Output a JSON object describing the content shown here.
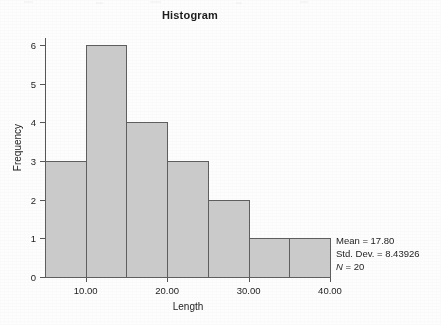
{
  "chart_data": {
    "type": "bar",
    "title": "Histogram",
    "xlabel": "Length",
    "ylabel": "Frequency",
    "categories": [
      "5-10",
      "10-15",
      "15-20",
      "20-25",
      "25-30",
      "30-35",
      "35-40"
    ],
    "bin_edges": [
      5,
      10,
      15,
      20,
      25,
      30,
      35,
      40
    ],
    "values": [
      3,
      6,
      4,
      3,
      2,
      1,
      1
    ],
    "bin_width": 5,
    "xlim": [
      5,
      40
    ],
    "ylim": [
      0,
      6
    ],
    "x_ticks": [
      10,
      20,
      30,
      40
    ],
    "x_tick_labels": [
      "10.00",
      "20.00",
      "30.00",
      "40.00"
    ],
    "y_ticks": [
      0,
      1,
      2,
      3,
      4,
      5,
      6
    ],
    "y_tick_labels": [
      "0",
      "1",
      "2",
      "3",
      "4",
      "5",
      "6"
    ],
    "grid": false,
    "legend": "none",
    "bar_fill_color": "#cacaca",
    "bar_edge_color": "#5e5e5e",
    "axis_color": "#575757",
    "text_color": "#1d1d1d",
    "annotations": [
      {
        "label": "Mean = ",
        "value": "17.80",
        "text": "Mean = 17.80"
      },
      {
        "label": "Std. Dev. = ",
        "value": "8.43926",
        "text": "Std. Dev. = 8.43926"
      },
      {
        "label": "N",
        "value": "20",
        "text": "N = 20"
      }
    ]
  },
  "stats": {
    "mean_line": "Mean = 17.80",
    "stddev_line": "Std. Dev. = 8.43926",
    "n_symbol": "N",
    "n_rest": " = 20"
  }
}
